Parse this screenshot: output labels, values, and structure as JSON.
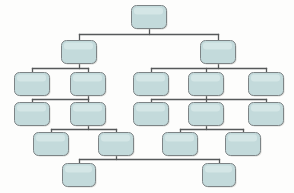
{
  "diagram": {
    "type": "tree-diagram",
    "canvas": {
      "width": 294,
      "height": 193,
      "background": "#fdfdfc"
    },
    "style": {
      "node_fill": "#c3dadb",
      "node_border": "#7d8486",
      "connector_color": "#56595a",
      "node_corner_radius": 5,
      "node_width": 34,
      "node_height": 22
    },
    "levels": [
      {
        "index": 0,
        "y": 5,
        "node_count": 1
      },
      {
        "index": 1,
        "y": 40,
        "node_count": 2
      },
      {
        "index": 2,
        "y": 72,
        "node_count": 5
      },
      {
        "index": 3,
        "y": 102,
        "node_count": 5
      },
      {
        "index": 4,
        "y": 132,
        "node_count": 4
      },
      {
        "index": 5,
        "y": 163,
        "node_count": 2
      }
    ],
    "nodes": [
      {
        "id": "n0",
        "label": "",
        "level": 0,
        "x": 131,
        "y": 5,
        "w": 35,
        "h": 23
      },
      {
        "id": "n1",
        "label": "",
        "level": 1,
        "x": 61,
        "y": 40,
        "w": 35,
        "h": 23
      },
      {
        "id": "n2",
        "label": "",
        "level": 1,
        "x": 200,
        "y": 40,
        "w": 35,
        "h": 23
      },
      {
        "id": "n3",
        "label": "",
        "level": 2,
        "x": 14,
        "y": 72,
        "w": 35,
        "h": 23
      },
      {
        "id": "n4",
        "label": "",
        "level": 2,
        "x": 70,
        "y": 72,
        "w": 35,
        "h": 23
      },
      {
        "id": "n5",
        "label": "",
        "level": 2,
        "x": 133,
        "y": 72,
        "w": 35,
        "h": 23
      },
      {
        "id": "n6",
        "label": "",
        "level": 2,
        "x": 188,
        "y": 72,
        "w": 35,
        "h": 23
      },
      {
        "id": "n7",
        "label": "",
        "level": 2,
        "x": 248,
        "y": 72,
        "w": 35,
        "h": 23
      },
      {
        "id": "n8",
        "label": "",
        "level": 3,
        "x": 14,
        "y": 102,
        "w": 35,
        "h": 23
      },
      {
        "id": "n9",
        "label": "",
        "level": 3,
        "x": 70,
        "y": 102,
        "w": 35,
        "h": 23
      },
      {
        "id": "n10",
        "label": "",
        "level": 3,
        "x": 133,
        "y": 102,
        "w": 35,
        "h": 23
      },
      {
        "id": "n11",
        "label": "",
        "level": 3,
        "x": 188,
        "y": 102,
        "w": 35,
        "h": 23
      },
      {
        "id": "n12",
        "label": "",
        "level": 3,
        "x": 248,
        "y": 102,
        "w": 35,
        "h": 23
      },
      {
        "id": "n13",
        "label": "",
        "level": 4,
        "x": 33,
        "y": 132,
        "w": 35,
        "h": 23
      },
      {
        "id": "n14",
        "label": "",
        "level": 4,
        "x": 98,
        "y": 132,
        "w": 35,
        "h": 23
      },
      {
        "id": "n15",
        "label": "",
        "level": 4,
        "x": 162,
        "y": 132,
        "w": 35,
        "h": 23
      },
      {
        "id": "n16",
        "label": "",
        "level": 4,
        "x": 225,
        "y": 132,
        "w": 35,
        "h": 23
      },
      {
        "id": "n17",
        "label": "",
        "level": 5,
        "x": 62,
        "y": 163,
        "w": 33,
        "h": 23
      },
      {
        "id": "n18",
        "label": "",
        "level": 5,
        "x": 202,
        "y": 163,
        "w": 33,
        "h": 23
      }
    ],
    "edges": [
      {
        "from": "n0",
        "to": "n1"
      },
      {
        "from": "n0",
        "to": "n2"
      },
      {
        "from": "n1",
        "to": "n3"
      },
      {
        "from": "n1",
        "to": "n4"
      },
      {
        "from": "n2",
        "to": "n5"
      },
      {
        "from": "n2",
        "to": "n6"
      },
      {
        "from": "n2",
        "to": "n7"
      },
      {
        "from": "n4",
        "to": "n8"
      },
      {
        "from": "n4",
        "to": "n9"
      },
      {
        "from": "n6",
        "to": "n10"
      },
      {
        "from": "n6",
        "to": "n11"
      },
      {
        "from": "n6",
        "to": "n12"
      },
      {
        "from": "n9",
        "to": "n13"
      },
      {
        "from": "n9",
        "to": "n14"
      },
      {
        "from": "n11",
        "to": "n15"
      },
      {
        "from": "n11",
        "to": "n16"
      },
      {
        "from": "n14",
        "to": "n17"
      },
      {
        "from": "n14",
        "to": "n18"
      }
    ]
  }
}
